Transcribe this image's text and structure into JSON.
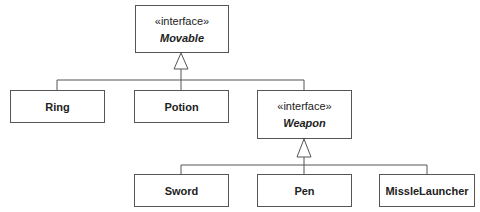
{
  "diagram": {
    "type": "UML class diagram",
    "interfaces": [
      {
        "id": "movable",
        "stereotype": "«interface»",
        "name": "Movable"
      },
      {
        "id": "weapon",
        "stereotype": "«interface»",
        "name": "Weapon"
      }
    ],
    "classes": [
      {
        "id": "ring",
        "name": "Ring"
      },
      {
        "id": "potion",
        "name": "Potion"
      },
      {
        "id": "sword",
        "name": "Sword"
      },
      {
        "id": "pen",
        "name": "Pen"
      },
      {
        "id": "misslelauncher",
        "name": "MissleLauncher"
      }
    ],
    "relations": [
      {
        "from": "ring",
        "to": "movable",
        "kind": "realization"
      },
      {
        "from": "potion",
        "to": "movable",
        "kind": "realization"
      },
      {
        "from": "weapon",
        "to": "movable",
        "kind": "generalization"
      },
      {
        "from": "sword",
        "to": "weapon",
        "kind": "realization"
      },
      {
        "from": "pen",
        "to": "weapon",
        "kind": "realization"
      },
      {
        "from": "misslelauncher",
        "to": "weapon",
        "kind": "realization"
      }
    ]
  }
}
